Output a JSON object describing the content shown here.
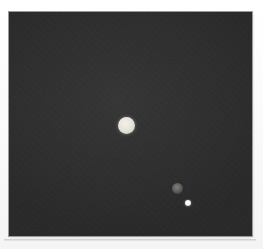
{
  "figure": {
    "type": "astronomical-image",
    "panel": {
      "background_color": "#2b2b2b",
      "border_color": "#9a9a9a",
      "x": 9,
      "y": 12,
      "width": 243,
      "height": 224
    },
    "page_background_color": "#fdfdfd"
  },
  "sources": [
    {
      "id": "primary",
      "label": "bright extended source",
      "center_x": 126,
      "center_y": 125,
      "diameter": 17,
      "color": "#e8e5dc",
      "brightness": "bright"
    },
    {
      "id": "faint",
      "label": "faint diffuse source",
      "center_x": 177,
      "center_y": 188,
      "diameter": 11,
      "color": "#8a8882",
      "brightness": "faint"
    },
    {
      "id": "point",
      "label": "point source",
      "center_x": 188,
      "center_y": 203,
      "diameter": 6,
      "color": "#ffffff",
      "brightness": "bright"
    }
  ]
}
